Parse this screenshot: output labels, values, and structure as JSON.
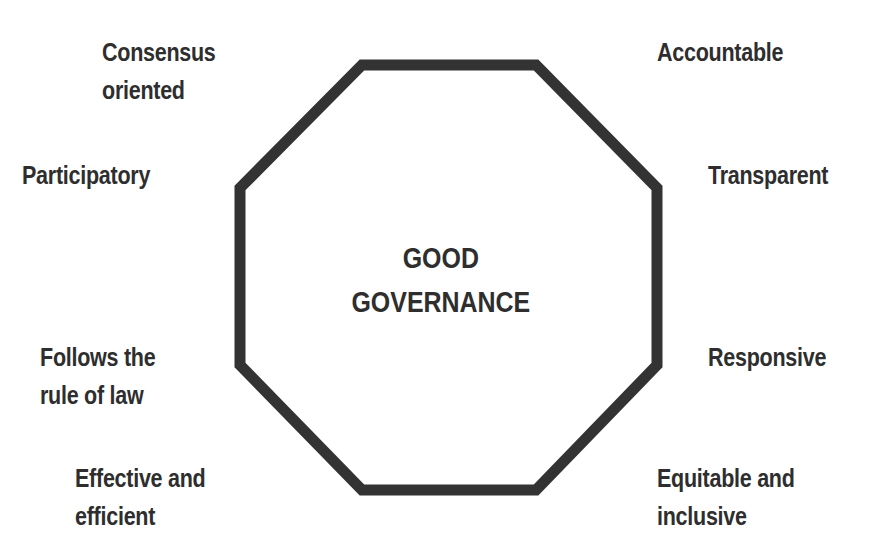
{
  "diagram": {
    "title_lines": [
      "GOOD",
      "GOVERNANCE"
    ],
    "shape": "octagon",
    "stroke_color": "#333333",
    "text_color": "#2e2e2e",
    "characteristics": [
      {
        "id": "consensus",
        "lines": [
          "Consensus",
          "oriented"
        ]
      },
      {
        "id": "accountable",
        "lines": [
          "Accountable"
        ]
      },
      {
        "id": "participatory",
        "lines": [
          "Participatory"
        ]
      },
      {
        "id": "transparent",
        "lines": [
          "Transparent"
        ]
      },
      {
        "id": "rule-of-law",
        "lines": [
          "Follows the",
          "rule of law"
        ]
      },
      {
        "id": "responsive",
        "lines": [
          "Responsive"
        ]
      },
      {
        "id": "effective",
        "lines": [
          "Effective and",
          "efficient"
        ]
      },
      {
        "id": "equitable",
        "lines": [
          "Equitable and",
          "inclusive"
        ]
      }
    ]
  }
}
